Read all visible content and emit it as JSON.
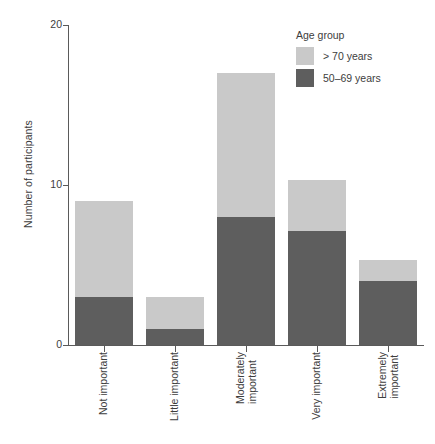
{
  "chart_data": {
    "type": "bar",
    "subtype": "stacked-vertical",
    "title": "",
    "xlabel": "",
    "ylabel": "Number of participants",
    "ylim": [
      0,
      20
    ],
    "yticks": [
      0,
      10,
      20
    ],
    "ytick_labels": [
      "0",
      "10",
      "20"
    ],
    "grid": false,
    "legend": {
      "title": "Age group",
      "position": "top-right",
      "entries": [
        {
          "name": "> 70 years",
          "color": "#c9c9c9"
        },
        {
          "name": "50–69 years",
          "color": "#5e5e5e"
        }
      ]
    },
    "categories": [
      "Not important",
      "Little important",
      "Moderately important",
      "Very important",
      "Extremely important"
    ],
    "category_lines": [
      [
        "Not important"
      ],
      [
        "Little important"
      ],
      [
        "Moderately",
        "important"
      ],
      [
        "Very important"
      ],
      [
        "Extremely",
        "important"
      ]
    ],
    "series": [
      {
        "name": "50–69 years",
        "color": "#5e5e5e",
        "values": [
          3,
          1,
          8,
          7.1,
          4
        ]
      },
      {
        "name": "> 70 years",
        "color": "#c9c9c9",
        "values": [
          6,
          2,
          9,
          3.2,
          1.3
        ]
      }
    ],
    "totals": [
      9,
      3,
      17,
      10.3,
      5.3
    ]
  },
  "axis": {
    "y_title": "Number of participants"
  }
}
